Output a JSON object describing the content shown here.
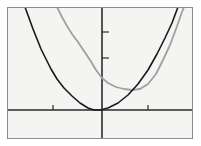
{
  "figure": {
    "type": "function-plot",
    "background_color": "#f4f4f2",
    "frame_color": "#8d8d8d",
    "axis_color": "#2b2b2b",
    "title": "",
    "caption": ""
  },
  "chart_data": {
    "type": "line",
    "title": "",
    "xlabel": "",
    "ylabel": "",
    "grid": false,
    "legend": "none",
    "xlim": [
      -3.35,
      3.35
    ],
    "ylim": [
      -0.85,
      7.5
    ],
    "xticks": [
      -1,
      1
    ],
    "xticklabels": [
      "",
      ""
    ],
    "yticks": [
      4,
      6
    ],
    "yticklabels": [
      "",
      ""
    ],
    "axis_origin_px": {
      "x": 102,
      "y": 110
    },
    "series": [
      {
        "name": "black-parabola",
        "color": "#1a1a1a",
        "width": 1.6,
        "vertex": [
          -0.45,
          0.0
        ],
        "points_px": [
          [
            25,
            7
          ],
          [
            29,
            18
          ],
          [
            33,
            29
          ],
          [
            37,
            39
          ],
          [
            41,
            49
          ],
          [
            46,
            59
          ],
          [
            51,
            69
          ],
          [
            57,
            79
          ],
          [
            64,
            88
          ],
          [
            72,
            96
          ],
          [
            80,
            103
          ],
          [
            88,
            108
          ],
          [
            94,
            110
          ],
          [
            100,
            110
          ],
          [
            108,
            108
          ],
          [
            118,
            103
          ],
          [
            128,
            95
          ],
          [
            138,
            84
          ],
          [
            148,
            70
          ],
          [
            157,
            54
          ],
          [
            165,
            38
          ],
          [
            172,
            23
          ],
          [
            178,
            7
          ]
        ]
      },
      {
        "name": "gray-parabola",
        "color": "#a0a0a0",
        "width": 1.8,
        "vertex": [
          1.05,
          0.95
        ],
        "points_px": [
          [
            57,
            7
          ],
          [
            62,
            17
          ],
          [
            67,
            26
          ],
          [
            72,
            34
          ],
          [
            78,
            42
          ],
          [
            84,
            51
          ],
          [
            90,
            60
          ],
          [
            96,
            70
          ],
          [
            102,
            78
          ],
          [
            108,
            83
          ],
          [
            116,
            87
          ],
          [
            124,
            89
          ],
          [
            132,
            90
          ],
          [
            140,
            89
          ],
          [
            148,
            84
          ],
          [
            156,
            74
          ],
          [
            163,
            60
          ],
          [
            170,
            45
          ],
          [
            176,
            29
          ],
          [
            182,
            12
          ],
          [
            184,
            7
          ]
        ]
      }
    ]
  },
  "axes": {
    "x_axis_name": "horizontal-axis",
    "y_axis_name": "vertical-axis",
    "x_tick_px": [
      53,
      148
    ],
    "y_tick_px": [
      32,
      58
    ],
    "tick_length": 5
  }
}
